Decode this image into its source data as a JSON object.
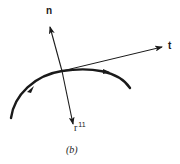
{
  "figure": {
    "caption": "(b)",
    "labels": {
      "normal": "n",
      "tangent": "t",
      "second_derivative_base": "r",
      "second_derivative_sup": "11"
    },
    "colors": {
      "ink": "#1a1a1a",
      "background": "#ffffff"
    }
  }
}
